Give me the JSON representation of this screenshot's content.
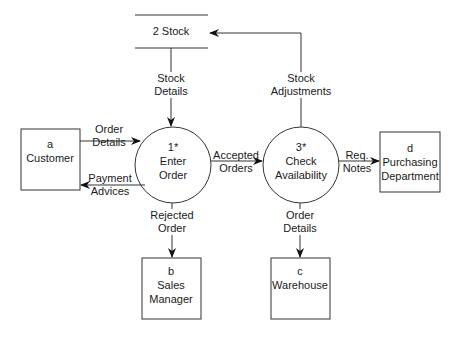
{
  "diagram": {
    "type": "data-flow-diagram",
    "data_store": {
      "id": "2",
      "label": "2 Stock"
    },
    "processes": [
      {
        "id": "1*",
        "name_line1": "Enter",
        "name_line2": "Order"
      },
      {
        "id": "3*",
        "name_line1": "Check",
        "name_line2": "Availability"
      }
    ],
    "entities": [
      {
        "id": "a",
        "line1": "Customer",
        "line2": ""
      },
      {
        "id": "b",
        "line1": "Sales",
        "line2": "Manager"
      },
      {
        "id": "c",
        "line1": "Warehouse",
        "line2": ""
      },
      {
        "id": "d",
        "line1": "Purchasing",
        "line2": "Department"
      }
    ],
    "flows": [
      {
        "line1": "Stock",
        "line2": "Details",
        "from": "2 Stock",
        "to": "1* Enter Order"
      },
      {
        "line1": "Stock",
        "line2": "Adjustments",
        "from": "3* Check Availability",
        "to": "2 Stock"
      },
      {
        "line1": "Order",
        "line2": "Details",
        "from": "a Customer",
        "to": "1* Enter Order"
      },
      {
        "line1": "Payment",
        "line2": "Advices",
        "from": "1* Enter Order",
        "to": "a Customer"
      },
      {
        "line1": "Accepted",
        "line2": "Orders",
        "from": "1* Enter Order",
        "to": "3* Check Availability"
      },
      {
        "line1": "Req.",
        "line2": "Notes",
        "from": "3* Check Availability",
        "to": "d Purchasing Department"
      },
      {
        "line1": "Rejected",
        "line2": "Order",
        "from": "1* Enter Order",
        "to": "b Sales Manager"
      },
      {
        "line1": "Order",
        "line2": "Details",
        "from": "3* Check Availability",
        "to": "c Warehouse"
      }
    ]
  }
}
